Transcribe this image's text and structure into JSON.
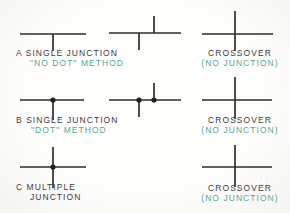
{
  "colors": {
    "line": "#2e2d2b",
    "dot": "#21201e",
    "text_primary": "#3d3c3a",
    "text_accent": "#57a796"
  },
  "rows": {
    "a": {
      "line1": "A SINGLE JUNCTION",
      "line2": "\"NO DOT\" METHOD",
      "right1": "CROSSOVER",
      "right2": "(NO JUNCTION)"
    },
    "b": {
      "line1": "B SINGLE JUNCTION",
      "line2": "\"DOT\" METHOD",
      "right1": "CROSSOVER",
      "right2": "(NO JUNCTION)"
    },
    "c": {
      "line1": "C MULTIPLE",
      "line2": "JUNCTION",
      "right1": "CROSSOVER",
      "right2": "(NO JUNCTION)"
    }
  },
  "symbols": [
    {
      "name": "single-junction-no-dot-tee",
      "segments": [
        [
          20,
          34,
          86,
          34
        ],
        [
          53,
          34,
          53,
          51
        ]
      ],
      "dots": []
    },
    {
      "name": "single-junction-no-dot-offset-tees",
      "segments": [
        [
          109,
          33,
          181,
          33
        ],
        [
          139,
          33,
          139,
          50
        ],
        [
          154,
          16,
          154,
          33
        ]
      ],
      "dots": []
    },
    {
      "name": "crossover-no-junction-top",
      "segments": [
        [
          202,
          34,
          273,
          34
        ],
        [
          235,
          11,
          235,
          51
        ]
      ],
      "dots": []
    },
    {
      "name": "single-junction-dot-tee",
      "segments": [
        [
          20,
          100,
          84,
          100
        ],
        [
          53,
          100,
          53,
          120
        ]
      ],
      "dots": [
        [
          53,
          100
        ]
      ]
    },
    {
      "name": "single-junction-dot-offset-tees",
      "segments": [
        [
          109,
          100,
          181,
          100
        ],
        [
          139,
          100,
          139,
          117
        ],
        [
          154,
          83,
          154,
          100
        ]
      ],
      "dots": [
        [
          139,
          100
        ],
        [
          154,
          100
        ]
      ]
    },
    {
      "name": "crossover-no-junction-middle",
      "segments": [
        [
          202,
          100,
          272,
          100
        ],
        [
          235,
          77,
          235,
          119
        ]
      ],
      "dots": []
    },
    {
      "name": "multiple-junction-cross-dot",
      "segments": [
        [
          20,
          167,
          86,
          167
        ],
        [
          53,
          147,
          53,
          188
        ]
      ],
      "dots": [
        [
          53,
          167
        ]
      ]
    },
    {
      "name": "crossover-no-junction-bottom",
      "segments": [
        [
          202,
          167,
          272,
          167
        ],
        [
          235,
          145,
          235,
          187
        ]
      ],
      "dots": []
    }
  ]
}
